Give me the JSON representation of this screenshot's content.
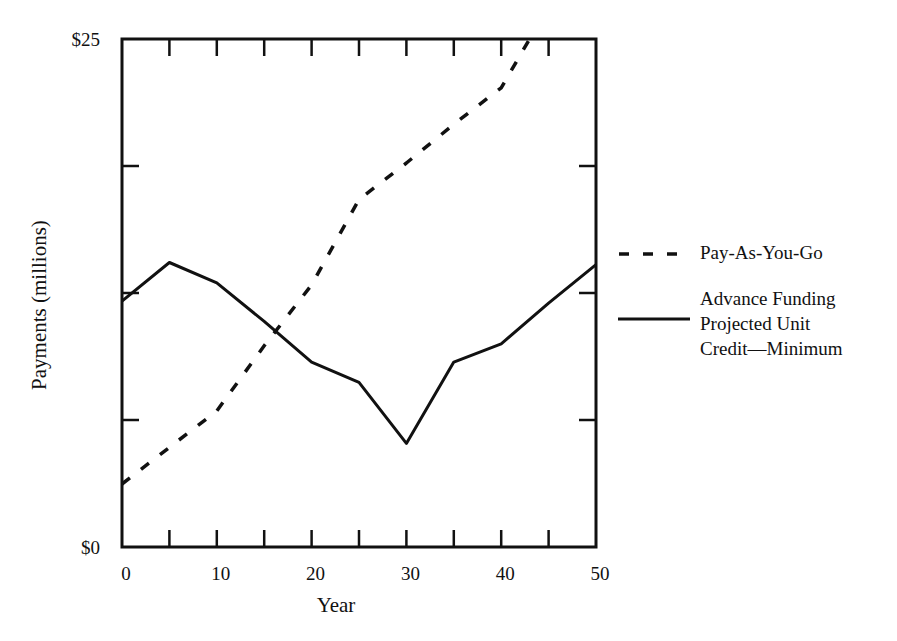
{
  "chart_data": {
    "type": "line",
    "title": "",
    "xlabel": "Year",
    "ylabel": "Payments (millions)",
    "xlim": [
      0,
      50
    ],
    "ylim": [
      0,
      25
    ],
    "x_ticks": [
      0,
      10,
      20,
      30,
      40,
      50
    ],
    "x_tick_labels": [
      "0",
      "10",
      "20",
      "30",
      "40",
      "50"
    ],
    "x_minor_tick_step": 5,
    "y_tick_labels": [
      "$0",
      "$25"
    ],
    "y_labeled_ticks": [
      0,
      25
    ],
    "y_unlabeled_ticks": [
      6.25,
      12.5,
      18.75
    ],
    "grid": false,
    "legend_position": "right",
    "series": [
      {
        "name": "Pay-As-You-Go",
        "style": "dashed",
        "x": [
          0,
          5,
          10,
          15,
          20,
          25,
          30,
          35,
          40,
          43
        ],
        "values": [
          3.1,
          4.9,
          6.7,
          9.9,
          12.9,
          17.1,
          18.9,
          20.8,
          22.6,
          25.0
        ]
      },
      {
        "name": "Advance Funding Projected Unit Credit—Minimum",
        "style": "solid",
        "x": [
          0,
          5,
          10,
          15,
          20,
          25,
          30,
          35,
          40,
          45,
          50
        ],
        "values": [
          12.1,
          14.0,
          13.0,
          11.1,
          9.1,
          8.1,
          5.1,
          9.1,
          10.0,
          12.0,
          13.9
        ]
      }
    ]
  },
  "legend": {
    "items": [
      {
        "lines": [
          "Pay-As-You-Go"
        ]
      },
      {
        "lines": [
          "Advance Funding",
          "Projected Unit",
          "Credit—Minimum"
        ]
      }
    ]
  }
}
